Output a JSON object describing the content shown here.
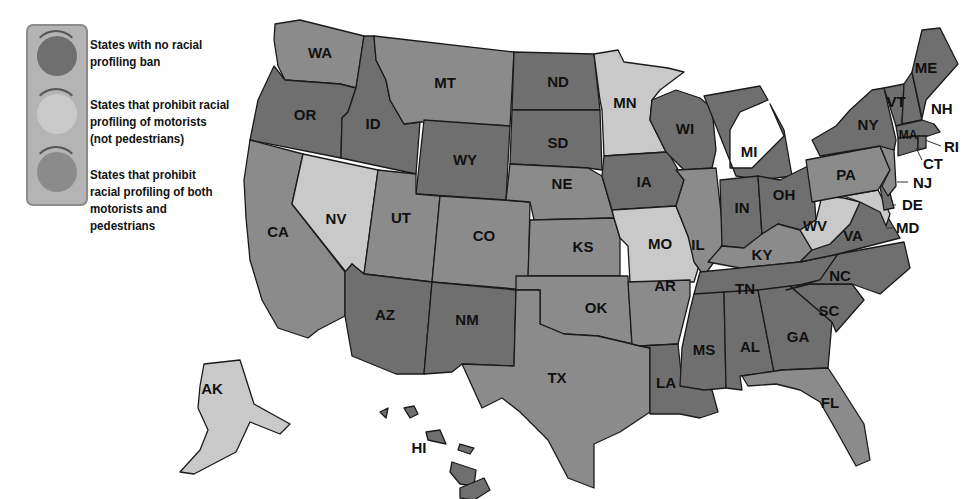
{
  "colors": {
    "no_ban": "#6f6f6f",
    "motorists_only": "#c9c9c9",
    "both": "#8b8b8b",
    "legend_bg": "#b4b4b4",
    "border": "#1a1a1a"
  },
  "legend": {
    "items": [
      {
        "key": "no_ban",
        "lines": [
          "States with no racial",
          "profiling ban"
        ]
      },
      {
        "key": "motorists_only",
        "lines": [
          "States that prohibit racial",
          "profiling of motorists",
          "(not pedestrians)"
        ]
      },
      {
        "key": "both",
        "lines": [
          "States that prohibit",
          "racial profiling of both",
          "motorists and",
          "pedestrians"
        ]
      }
    ]
  },
  "states": {
    "WA": "both",
    "OR": "no_ban",
    "CA": "both",
    "NV": "motorists_only",
    "ID": "no_ban",
    "MT": "both",
    "WY": "no_ban",
    "UT": "both",
    "CO": "both",
    "AZ": "no_ban",
    "NM": "no_ban",
    "ND": "no_ban",
    "SD": "no_ban",
    "NE": "both",
    "KS": "both",
    "OK": "both",
    "TX": "both",
    "MN": "motorists_only",
    "IA": "no_ban",
    "MO": "motorists_only",
    "AR": "both",
    "LA": "no_ban",
    "WI": "no_ban",
    "IL": "both",
    "MI": "no_ban",
    "IN": "no_ban",
    "OH": "no_ban",
    "KY": "both",
    "TN": "no_ban",
    "MS": "no_ban",
    "AL": "no_ban",
    "GA": "no_ban",
    "FL": "both",
    "SC": "no_ban",
    "NC": "no_ban",
    "VA": "no_ban",
    "WV": "motorists_only",
    "MD": "motorists_only",
    "DE": "no_ban",
    "PA": "both",
    "NJ": "both",
    "NY": "no_ban",
    "CT": "no_ban",
    "RI": "no_ban",
    "MA": "no_ban",
    "VT": "no_ban",
    "NH": "no_ban",
    "ME": "no_ban",
    "AK": "motorists_only",
    "HI": "no_ban"
  },
  "labels": {
    "WA": "WA",
    "OR": "OR",
    "CA": "CA",
    "NV": "NV",
    "ID": "ID",
    "MT": "MT",
    "WY": "WY",
    "UT": "UT",
    "CO": "CO",
    "AZ": "AZ",
    "NM": "NM",
    "ND": "ND",
    "SD": "SD",
    "NE": "NE",
    "KS": "KS",
    "OK": "OK",
    "TX": "TX",
    "MN": "MN",
    "IA": "IA",
    "MO": "MO",
    "AR": "AR",
    "LA": "LA",
    "WI": "WI",
    "IL": "IL",
    "MI": "MI",
    "IN": "IN",
    "OH": "OH",
    "KY": "KY",
    "TN": "TN",
    "MS": "MS",
    "AL": "AL",
    "GA": "GA",
    "FL": "FL",
    "SC": "SC",
    "NC": "NC",
    "VA": "VA",
    "WV": "WV",
    "MD": "MD",
    "DE": "DE",
    "PA": "PA",
    "NJ": "NJ",
    "NY": "NY",
    "CT": "CT",
    "RI": "RI",
    "MA": "MA",
    "VT": "VT",
    "NH": "NH",
    "ME": "ME",
    "AK": "AK",
    "HI": "HI"
  }
}
